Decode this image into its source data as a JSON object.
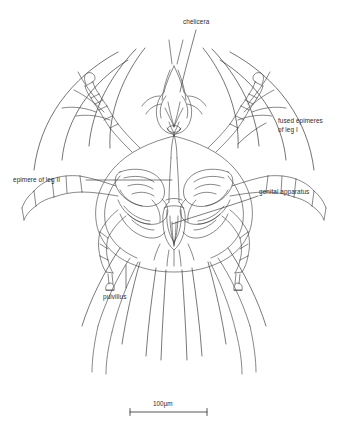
{
  "figure": {
    "background_color": "#ffffff",
    "ink_color": "#3a3a3a",
    "label_color": "#2b2b2b",
    "width": 348,
    "height": 433
  },
  "labels": {
    "chelicera": "chelicera",
    "fused_epimeres": "fused epimeres\nof leg I",
    "fused_epimeres_line1": "fused epimeres",
    "fused_epimeres_line2": "of leg I",
    "epimere_leg_ii": "epimere of leg II",
    "genital_apparatus": "genital apparatus",
    "pulvillus": "pulvillus"
  },
  "scale_bar": {
    "text": "100µm",
    "value": 100,
    "unit": "µm",
    "x_start": 130,
    "x_end": 207,
    "y": 412
  }
}
